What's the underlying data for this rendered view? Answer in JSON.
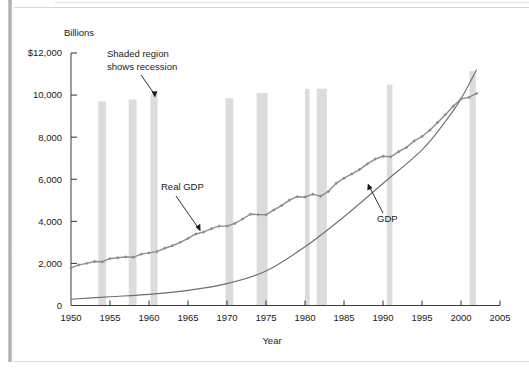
{
  "figure": {
    "unit_label": "Billions",
    "x_axis_title": "Year",
    "annotations": {
      "recession_note_line1": "Shaded region",
      "recession_note_line2": "shows recession",
      "real_gdp_label": "Real GDP",
      "gdp_label": "GDP"
    }
  },
  "chart_data": {
    "type": "line",
    "title": "",
    "subtitle": "",
    "xlabel": "Year",
    "ylabel": "Billions",
    "xlim": [
      1950,
      2005
    ],
    "ylim": [
      0,
      12000
    ],
    "grid": false,
    "legend_position": "inline-annotations",
    "xticks": [
      "1950",
      "1955",
      "1960",
      "1965",
      "1970",
      "1975",
      "1980",
      "1985",
      "1990",
      "1995",
      "2000",
      "2005"
    ],
    "yticks": [
      "0",
      "2,000",
      "4,000",
      "6,000",
      "8,000",
      "10,000",
      "$12,000"
    ],
    "colors": {
      "real_gdp_line": "#8c8c8c",
      "gdp_line": "#6e6e6e",
      "recession_band": "#dcdcdc",
      "axis": "#333333",
      "text": "#1a1a1a"
    },
    "series": [
      {
        "name": "Real GDP",
        "marker": "diamond",
        "x": [
          1950,
          1951,
          1952,
          1953,
          1954,
          1955,
          1956,
          1957,
          1958,
          1959,
          1960,
          1961,
          1962,
          1963,
          1964,
          1965,
          1966,
          1967,
          1968,
          1969,
          1970,
          1971,
          1972,
          1973,
          1974,
          1975,
          1976,
          1977,
          1978,
          1979,
          1980,
          1981,
          1982,
          1983,
          1984,
          1985,
          1986,
          1987,
          1988,
          1989,
          1990,
          1991,
          1992,
          1993,
          1994,
          1995,
          1996,
          1997,
          1998,
          1999,
          2000,
          2001,
          2002
        ],
        "values": [
          1790,
          1930,
          2000,
          2090,
          2080,
          2230,
          2270,
          2310,
          2290,
          2440,
          2500,
          2560,
          2720,
          2840,
          3000,
          3190,
          3400,
          3490,
          3650,
          3770,
          3770,
          3900,
          4110,
          4340,
          4320,
          4310,
          4540,
          4750,
          5010,
          5170,
          5160,
          5290,
          5190,
          5420,
          5810,
          6050,
          6250,
          6460,
          6730,
          6960,
          7090,
          7070,
          7310,
          7510,
          7820,
          8030,
          8330,
          8700,
          9070,
          9470,
          9820,
          9890,
          10080
        ],
        "value_units": "billions of chained dollars"
      },
      {
        "name": "GDP",
        "marker": "none",
        "x": [
          1950,
          1955,
          1960,
          1965,
          1970,
          1975,
          1980,
          1985,
          1990,
          1995,
          1998,
          2000,
          2002
        ],
        "values": [
          300,
          415,
          530,
          720,
          1040,
          1640,
          2790,
          4220,
          5800,
          7400,
          8750,
          9820,
          11200
        ],
        "value_units": "billions of current dollars"
      }
    ],
    "recession_bands": [
      {
        "start": 1953.5,
        "end": 1954.5,
        "top": 9700
      },
      {
        "start": 1957.4,
        "end": 1958.4,
        "top": 9800
      },
      {
        "start": 1960.2,
        "end": 1961.1,
        "top": 10050
      },
      {
        "start": 1969.8,
        "end": 1970.8,
        "top": 9850
      },
      {
        "start": 1973.8,
        "end": 1975.2,
        "top": 10100
      },
      {
        "start": 1980.0,
        "end": 1980.6,
        "top": 10300
      },
      {
        "start": 1981.5,
        "end": 1982.8,
        "top": 10300
      },
      {
        "start": 1990.5,
        "end": 1991.2,
        "top": 10500
      },
      {
        "start": 2001.1,
        "end": 2001.9,
        "top": 11150
      }
    ]
  }
}
